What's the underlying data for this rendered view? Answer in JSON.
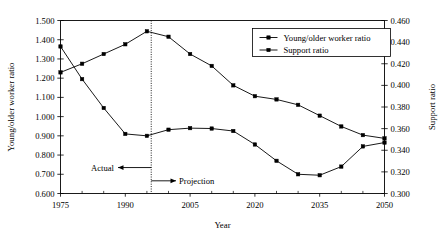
{
  "chart_data": {
    "type": "line",
    "title": "",
    "xlabel": "Year",
    "ylabel": "Young/older worker ratio",
    "y2label": "Support ratio",
    "xlim": [
      1975,
      2050
    ],
    "ylim": [
      0.6,
      1.5
    ],
    "y2lim": [
      0.3,
      0.46
    ],
    "grid": false,
    "legend_position": "top-right",
    "x_tick_labels": [
      "1975",
      "1990",
      "2005",
      "2020",
      "2035",
      "2050"
    ],
    "x_ticks": [
      1975,
      1990,
      2005,
      2020,
      2035,
      2050
    ],
    "x_minor_step": 5,
    "y_tick_labels": [
      "0.600",
      "0.700",
      "0.800",
      "0.900",
      "1.000",
      "1.100",
      "1.200",
      "1.300",
      "1.400",
      "1.500"
    ],
    "y_ticks": [
      0.6,
      0.7,
      0.8,
      0.9,
      1.0,
      1.1,
      1.2,
      1.3,
      1.4,
      1.5
    ],
    "y2_tick_labels": [
      "0.300",
      "0.320",
      "0.340",
      "0.360",
      "0.380",
      "0.400",
      "0.420",
      "0.440",
      "0.460"
    ],
    "y2_ticks": [
      0.3,
      0.32,
      0.34,
      0.36,
      0.38,
      0.4,
      0.42,
      0.44,
      0.46
    ],
    "series": [
      {
        "name": "Young/older worker ratio",
        "axis": "left",
        "marker": "square",
        "x": [
          1975,
          1980,
          1985,
          1990,
          1995,
          2000,
          2005,
          2010,
          2015,
          2020,
          2025,
          2030,
          2035,
          2040,
          2045,
          2050
        ],
        "values": [
          1.365,
          1.195,
          1.045,
          0.91,
          0.9,
          0.932,
          0.94,
          0.938,
          0.925,
          0.855,
          0.77,
          0.7,
          0.695,
          0.74,
          0.845,
          0.865
        ]
      },
      {
        "name": "Support ratio",
        "axis": "right",
        "marker": "square",
        "x": [
          1975,
          1980,
          1985,
          1990,
          1995,
          2000,
          2005,
          2010,
          2015,
          2020,
          2025,
          2030,
          2035,
          2040,
          2045,
          2050
        ],
        "values": [
          0.412,
          0.42,
          0.429,
          0.438,
          0.45,
          0.445,
          0.429,
          0.418,
          0.4,
          0.39,
          0.387,
          0.382,
          0.372,
          0.362,
          0.354,
          0.351
        ]
      }
    ],
    "annotations": [
      {
        "text": "Actual",
        "role": "actual-label"
      },
      {
        "text": "Projection",
        "role": "projection-label"
      }
    ],
    "divider_year": 1996
  },
  "legend": {
    "entries": [
      "Young/older worker ratio",
      "Support ratio"
    ]
  }
}
